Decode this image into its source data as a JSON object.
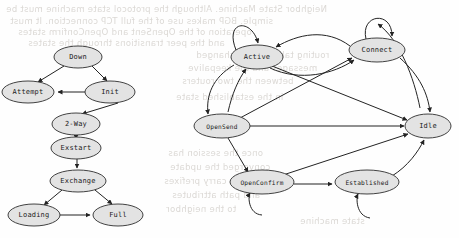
{
  "page": {
    "width": 459,
    "height": 238,
    "background_color": "#fefefe",
    "node_fill_color": "#e3e3e3",
    "node_stroke_color": "#2e2e2e",
    "edge_color": "#232323",
    "bleed_text_color": "#cfcbc6"
  },
  "bleed_through_lines": [
    {
      "text": "Neighbor State Machine. Although the protocol state machine must be",
      "x": 6,
      "y": 4
    },
    {
      "text": "simple. BGP makes use of the full TCP connection. It must",
      "x": 10,
      "y": 16
    },
    {
      "text": "operation of the OpenSent and OpenConfirm states",
      "x": 18,
      "y": 27
    },
    {
      "text": "and the peer transitions through the states",
      "x": 28,
      "y": 38
    },
    {
      "text": "routing tables are exchanged",
      "x": 196,
      "y": 50
    },
    {
      "text": "messages and the keepalive",
      "x": 188,
      "y": 63
    },
    {
      "text": "between the two routers",
      "x": 182,
      "y": 76
    },
    {
      "text": "in the established state",
      "x": 176,
      "y": 92
    },
    {
      "text": "once the session has",
      "x": 168,
      "y": 148
    },
    {
      "text": "converged the update",
      "x": 170,
      "y": 162
    },
    {
      "text": "messages carry prefixes",
      "x": 164,
      "y": 176
    },
    {
      "text": "and path attributes",
      "x": 172,
      "y": 190
    },
    {
      "text": "to the neighbor",
      "x": 166,
      "y": 204
    },
    {
      "text": "state machine",
      "x": 300,
      "y": 216
    }
  ],
  "diagrams": [
    {
      "name": "ospf-neighbor-state-machine",
      "nodes": [
        {
          "id": "down",
          "label": "Down",
          "cx": 78,
          "cy": 57,
          "rx": 24,
          "ry": 11
        },
        {
          "id": "attempt",
          "label": "Attempt",
          "cx": 28,
          "cy": 92,
          "rx": 26,
          "ry": 11
        },
        {
          "id": "init",
          "label": "Init",
          "cx": 110,
          "cy": 92,
          "rx": 25,
          "ry": 11
        },
        {
          "id": "twoway",
          "label": "2-Way",
          "cx": 76,
          "cy": 124,
          "rx": 24,
          "ry": 11
        },
        {
          "id": "exstart",
          "label": "Exstart",
          "cx": 76,
          "cy": 148,
          "rx": 25,
          "ry": 11
        },
        {
          "id": "exchange",
          "label": "Exchange",
          "cx": 78,
          "cy": 181,
          "rx": 28,
          "ry": 11
        },
        {
          "id": "loading",
          "label": "Loading",
          "cx": 34,
          "cy": 215,
          "rx": 26,
          "ry": 11
        },
        {
          "id": "full",
          "label": "Full",
          "cx": 118,
          "cy": 215,
          "rx": 25,
          "ry": 11
        }
      ],
      "edges": [
        {
          "from": "down",
          "to": "attempt"
        },
        {
          "from": "down",
          "to": "init"
        },
        {
          "from": "init",
          "to": "attempt"
        },
        {
          "from": "init",
          "to": "twoway"
        },
        {
          "from": "twoway",
          "to": "exstart"
        },
        {
          "from": "exstart",
          "to": "exchange"
        },
        {
          "from": "exchange",
          "to": "loading"
        },
        {
          "from": "exchange",
          "to": "full"
        },
        {
          "from": "loading",
          "to": "full"
        }
      ]
    },
    {
      "name": "bgp-finite-state-machine",
      "nodes": [
        {
          "id": "active",
          "cx": 257,
          "cy": 57,
          "rx": 26,
          "ry": 12,
          "label": "Active"
        },
        {
          "id": "connect",
          "cx": 377,
          "cy": 50,
          "rx": 28,
          "ry": 12,
          "label": "Connect"
        },
        {
          "id": "opensend",
          "cx": 222,
          "cy": 126,
          "rx": 28,
          "ry": 12,
          "label": "OpenSend"
        },
        {
          "id": "idle",
          "cx": 428,
          "cy": 126,
          "rx": 23,
          "ry": 12,
          "label": "Idle"
        },
        {
          "id": "openconfirm",
          "cx": 262,
          "cy": 182,
          "rx": 32,
          "ry": 12,
          "label": "OpenConfirm"
        },
        {
          "id": "established",
          "cx": 367,
          "cy": 182,
          "rx": 32,
          "ry": 12,
          "label": "Established"
        }
      ],
      "edges": [
        {
          "from": "idle",
          "to": "connect",
          "type": "curve"
        },
        {
          "from": "connect",
          "to": "connect",
          "type": "self-loop"
        },
        {
          "from": "connect",
          "to": "active",
          "type": "curve"
        },
        {
          "from": "active",
          "to": "connect",
          "type": "curve"
        },
        {
          "from": "active",
          "to": "active",
          "type": "self-loop"
        },
        {
          "from": "active",
          "to": "opensend",
          "type": "curve"
        },
        {
          "from": "opensend",
          "to": "active",
          "type": "curve"
        },
        {
          "from": "active",
          "to": "idle",
          "type": "line"
        },
        {
          "from": "opensend",
          "to": "connect",
          "type": "line"
        },
        {
          "from": "opensend",
          "to": "idle",
          "type": "line"
        },
        {
          "from": "connect",
          "to": "idle",
          "type": "curve"
        },
        {
          "from": "opensend",
          "to": "openconfirm",
          "type": "line"
        },
        {
          "from": "openconfirm",
          "to": "openconfirm",
          "type": "self-loop"
        },
        {
          "from": "openconfirm",
          "to": "idle",
          "type": "line"
        },
        {
          "from": "openconfirm",
          "to": "established",
          "type": "line"
        },
        {
          "from": "established",
          "to": "established",
          "type": "self-loop"
        },
        {
          "from": "established",
          "to": "idle",
          "type": "line"
        }
      ]
    }
  ]
}
